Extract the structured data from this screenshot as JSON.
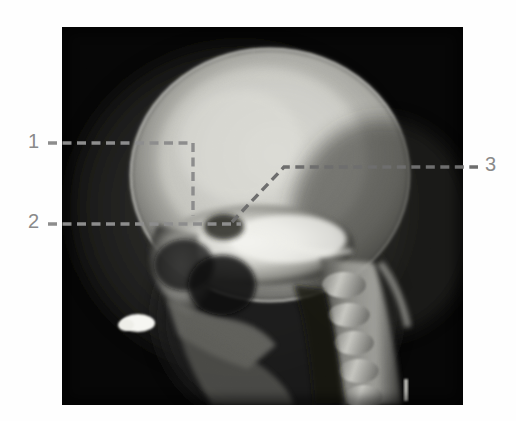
{
  "figure": {
    "kind": "radiograph",
    "modality": "X-ray",
    "view": "lateral skull",
    "caption": "",
    "background_color": "#ffffff",
    "plate_color": "#050505"
  },
  "image": {
    "description": "Lateral radiograph of a paediatric skull showing the calvarium, facial bones, skull base and upper cervical spine",
    "plate": {
      "x": 62,
      "y": 27,
      "width": 401,
      "height": 378
    },
    "anatomy_visible": [
      "frontal bone",
      "parietal bone",
      "occipital bone",
      "coronal suture",
      "skull base",
      "sella turcica",
      "mandible",
      "cervical vertebrae"
    ]
  },
  "annotations": {
    "line_color": "#8d8d8d",
    "label_color": "#8a8a8a",
    "style": "dashed",
    "items": [
      {
        "id": "1",
        "label": "1",
        "label_x": 28,
        "label_y": 131,
        "side": "left",
        "path": "M 48 143 H 193 V 216",
        "points": [
          [
            48,
            143
          ],
          [
            193,
            143
          ],
          [
            193,
            216
          ]
        ]
      },
      {
        "id": "2",
        "label": "2",
        "label_x": 28,
        "label_y": 211,
        "side": "left",
        "path": "M 48 224 H 241",
        "points": [
          [
            48,
            224
          ],
          [
            241,
            224
          ]
        ]
      },
      {
        "id": "3",
        "label": "3",
        "label_x": 485,
        "label_y": 154,
        "side": "right",
        "path": "M 232 222 L 284 167 H 478",
        "points": [
          [
            232,
            222
          ],
          [
            284,
            167
          ],
          [
            478,
            167
          ]
        ]
      }
    ]
  }
}
